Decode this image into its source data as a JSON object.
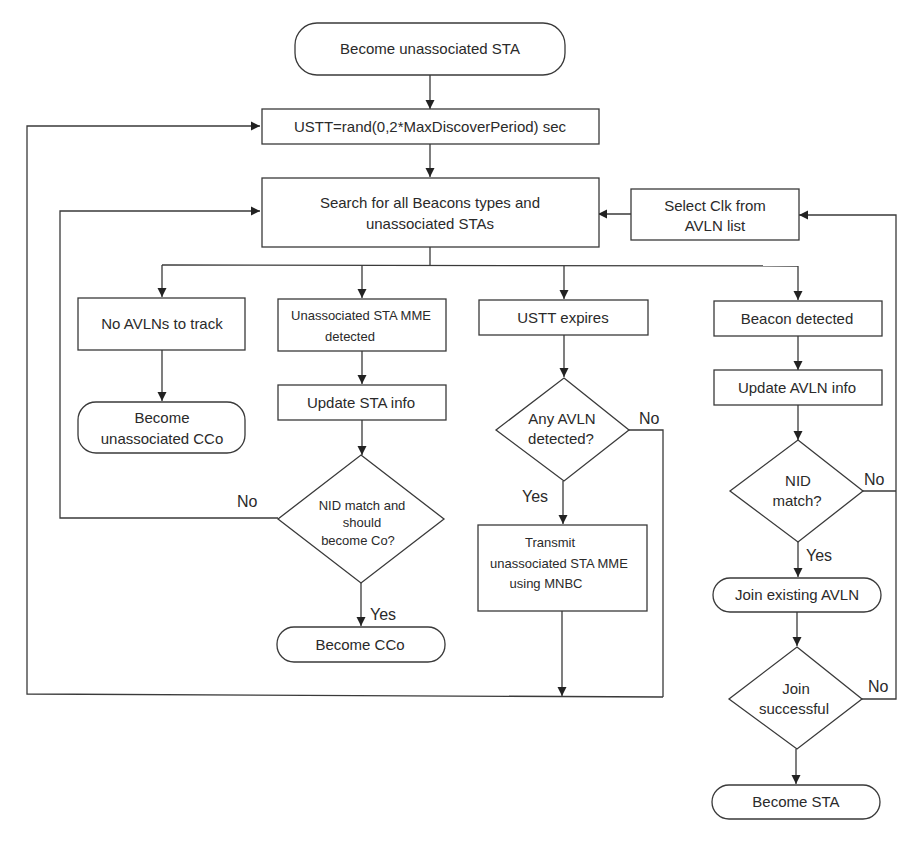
{
  "diagram": {
    "type": "flowchart",
    "nodes": {
      "start": {
        "shape": "terminator",
        "text": "Become unassociated STA"
      },
      "ustt": {
        "shape": "process",
        "text": "USTT=rand(0,2*MaxDiscoverPeriod) sec"
      },
      "search": {
        "shape": "process",
        "line1": "Search for all Beacons types and",
        "line2": "unassociated STAs"
      },
      "select_clk": {
        "shape": "process",
        "line1": "Select Clk from",
        "line2": "AVLN list"
      },
      "no_avlns": {
        "shape": "process",
        "text": "No AVLNs to track"
      },
      "become_uncco": {
        "shape": "terminator",
        "line1": "Become",
        "line2": "unassociated CCo"
      },
      "unassoc_mme": {
        "shape": "process",
        "line1": "Unassociated STA MME",
        "line2": "detected"
      },
      "update_sta": {
        "shape": "process",
        "text": "Update STA info"
      },
      "nid_match_co": {
        "shape": "decision",
        "line1": "NID match and",
        "line2": "should",
        "line3": "become Co?"
      },
      "become_cco": {
        "shape": "terminator",
        "text": "Become CCo"
      },
      "ustt_expires": {
        "shape": "process",
        "text": "USTT expires"
      },
      "any_avln": {
        "shape": "decision",
        "line1": "Any AVLN",
        "line2": "detected?"
      },
      "transmit": {
        "shape": "process",
        "line1": "Transmit",
        "line2": "unassociated STA MME",
        "line3": "using MNBC"
      },
      "beacon": {
        "shape": "process",
        "text": "Beacon detected"
      },
      "update_avln": {
        "shape": "process",
        "text": "Update AVLN info"
      },
      "nid_match": {
        "shape": "decision",
        "line1": "NID",
        "line2": "match?"
      },
      "join_existing": {
        "shape": "terminator",
        "text": "Join existing AVLN"
      },
      "join_success": {
        "shape": "decision",
        "line1": "Join",
        "line2": "successful"
      },
      "become_sta": {
        "shape": "terminator",
        "text": "Become STA"
      }
    },
    "edge_labels": {
      "nid_co_no": "No",
      "nid_co_yes": "Yes",
      "any_avln_no": "No",
      "any_avln_yes": "Yes",
      "nid_no": "No",
      "nid_yes": "Yes",
      "join_no": "No"
    },
    "edges": [
      [
        "start",
        "ustt"
      ],
      [
        "ustt",
        "search"
      ],
      [
        "search",
        "no_avlns"
      ],
      [
        "search",
        "unassoc_mme"
      ],
      [
        "search",
        "ustt_expires"
      ],
      [
        "search",
        "beacon"
      ],
      [
        "no_avlns",
        "become_uncco"
      ],
      [
        "unassoc_mme",
        "update_sta"
      ],
      [
        "update_sta",
        "nid_match_co"
      ],
      [
        "nid_match_co",
        "search",
        "No"
      ],
      [
        "nid_match_co",
        "become_cco",
        "Yes"
      ],
      [
        "ustt_expires",
        "any_avln"
      ],
      [
        "any_avln",
        "transmit",
        "Yes"
      ],
      [
        "any_avln",
        "ustt",
        "No"
      ],
      [
        "transmit",
        "ustt"
      ],
      [
        "beacon",
        "update_avln"
      ],
      [
        "update_avln",
        "nid_match"
      ],
      [
        "nid_match",
        "join_existing",
        "Yes"
      ],
      [
        "nid_match",
        "select_clk",
        "No"
      ],
      [
        "join_existing",
        "join_success"
      ],
      [
        "join_success",
        "become_sta",
        "Yes"
      ],
      [
        "join_success",
        "select_clk",
        "No"
      ],
      [
        "select_clk",
        "search"
      ]
    ],
    "colors": {
      "stroke": "#3a3a3a",
      "text": "#2a2a2a",
      "background": "#ffffff"
    }
  }
}
